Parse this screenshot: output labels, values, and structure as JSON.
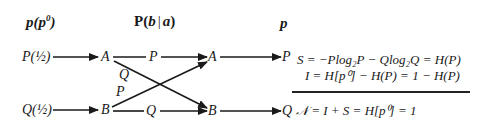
{
  "headers": {
    "input": "p(p⁰)",
    "input_base": "p(p",
    "input_sup": "0",
    "input_close": ")",
    "channel": "P(b | a)",
    "channel_P": "P(",
    "channel_b": "b",
    "channel_bar": "|",
    "channel_a": "a",
    "channel_close": ")",
    "output": "p"
  },
  "inputs": [
    {
      "prob": "P(½)",
      "symbol": "A"
    },
    {
      "prob": "Q(½)",
      "symbol": "B"
    }
  ],
  "channel_edges": [
    {
      "from": "A",
      "to": "A",
      "label": "P"
    },
    {
      "from": "A",
      "to": "B",
      "label": "Q"
    },
    {
      "from": "B",
      "to": "A",
      "label": "P"
    },
    {
      "from": "B",
      "to": "B",
      "label": "Q"
    }
  ],
  "outputs_mid": [
    "A",
    "B"
  ],
  "outputs": [
    "P",
    "Q"
  ],
  "equations": {
    "entropy": "S = −Plog₂P − Qlog₂Q = H(P)",
    "information": "I = H[p⁰] − H(P) = 1 − H(P)",
    "total": "𝒩 = I + S = H[p⁰] = 1"
  },
  "colors": {
    "ink": "#1a1a1a",
    "background": "#ffffff"
  }
}
